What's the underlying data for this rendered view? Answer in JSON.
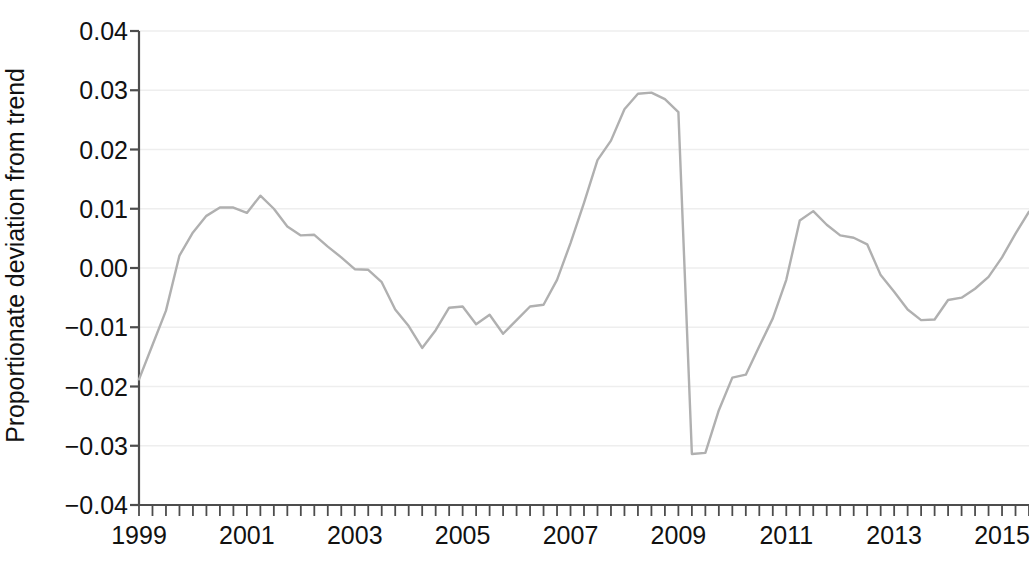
{
  "chart_data": {
    "type": "line",
    "title": "",
    "xlabel": "",
    "ylabel": "Proportionate deviation from trend",
    "xlim": [
      1999.0,
      2015.5
    ],
    "ylim": [
      -0.04,
      0.04
    ],
    "grid": true,
    "legend": null,
    "y_ticks": [
      0.04,
      0.03,
      0.02,
      0.01,
      0.0,
      -0.01,
      -0.02,
      -0.03,
      -0.04
    ],
    "y_tick_labels": [
      "0.04",
      "0.03",
      "0.02",
      "0.01",
      "0.00",
      "−0.01",
      "−0.02",
      "−0.03",
      "−0.04"
    ],
    "x_ticks": [
      1999,
      2001,
      2003,
      2005,
      2007,
      2009,
      2011,
      2013,
      2015
    ],
    "x_tick_labels": [
      "1999",
      "2001",
      "2003",
      "2005",
      "2007",
      "2009",
      "2011",
      "2013",
      "2015"
    ],
    "x_minor_tick_step": 0.25,
    "line_color": "#b0b0b0",
    "line_width": 2.4,
    "grid_color": "#eeeeee",
    "axis_color": "#4d4d4d",
    "series": [
      {
        "name": "Proportionate deviation from trend",
        "x": [
          1999.0,
          1999.25,
          1999.5,
          1999.75,
          2000.0,
          2000.25,
          2000.5,
          2000.75,
          2001.0,
          2001.25,
          2001.5,
          2001.75,
          2002.0,
          2002.25,
          2002.5,
          2002.75,
          2003.0,
          2003.25,
          2003.5,
          2003.75,
          2004.0,
          2004.25,
          2004.5,
          2004.75,
          2005.0,
          2005.25,
          2005.5,
          2005.75,
          2006.0,
          2006.25,
          2006.5,
          2006.75,
          2007.0,
          2007.25,
          2007.5,
          2007.75,
          2008.0,
          2008.25,
          2008.5,
          2008.75,
          2009.0,
          2009.25,
          2009.5,
          2009.75,
          2010.0,
          2010.25,
          2010.5,
          2010.75,
          2011.0,
          2011.25,
          2011.5,
          2011.75,
          2012.0,
          2012.25,
          2012.5,
          2012.75,
          2013.0,
          2013.25,
          2013.5,
          2013.75,
          2014.0,
          2014.25,
          2014.5,
          2014.75,
          2015.0,
          2015.25,
          2015.5
        ],
        "y": [
          -0.0188,
          -0.013,
          -0.0072,
          0.0021,
          0.006,
          0.0088,
          0.0102,
          0.0102,
          0.0093,
          0.0122,
          0.01,
          0.007,
          0.0055,
          0.0056,
          0.0036,
          0.0018,
          -0.0002,
          -0.0003,
          -0.0024,
          -0.007,
          -0.0098,
          -0.0135,
          -0.0105,
          -0.0067,
          -0.0065,
          -0.0095,
          -0.0079,
          -0.0111,
          -0.0088,
          -0.0065,
          -0.0062,
          -0.002,
          0.0042,
          0.011,
          0.0182,
          0.0215,
          0.0268,
          0.0294,
          0.0296,
          0.0285,
          0.0263,
          -0.0314,
          -0.0312,
          -0.024,
          -0.0185,
          -0.018,
          -0.0132,
          -0.0085,
          -0.002,
          0.008,
          0.0096,
          0.0073,
          0.0055,
          0.0051,
          0.004,
          -0.0012,
          -0.004,
          -0.007,
          -0.0088,
          -0.0087,
          -0.0054,
          -0.005,
          -0.0035,
          -0.0015,
          0.0018,
          0.0058,
          0.0095
        ]
      }
    ]
  }
}
